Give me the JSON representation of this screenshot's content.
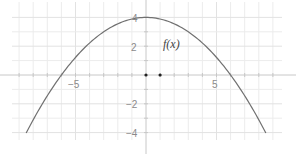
{
  "chart_data": {
    "type": "line",
    "title": "",
    "xlabel": "",
    "ylabel": "",
    "function_label": "f(x)",
    "expression": "f(x) = 4 - x^2/9",
    "xlim": [
      -10.5,
      10.5
    ],
    "ylim": [
      -5.5,
      5.2
    ],
    "grid": true,
    "minor_grid_step": 1,
    "major_grid_step": 2.5,
    "x_tick_labels": [
      {
        "value": -5,
        "label": "−5"
      },
      {
        "value": 5,
        "label": "5"
      }
    ],
    "y_tick_labels": [
      {
        "value": 4,
        "label": "4"
      },
      {
        "value": 2,
        "label": "2"
      },
      {
        "value": -2,
        "label": "−2"
      },
      {
        "value": -4,
        "label": "−4"
      }
    ],
    "series": [
      {
        "name": "f(x)",
        "x": [
          -8.5,
          -8,
          -7,
          -6,
          -5,
          -4,
          -3,
          -2,
          -1,
          0,
          1,
          2,
          3,
          4,
          5,
          6,
          7,
          8,
          8.5
        ],
        "values": [
          -4.03,
          -3.11,
          -1.44,
          0.0,
          1.22,
          2.22,
          3.0,
          3.56,
          3.89,
          4.0,
          3.89,
          3.56,
          3.0,
          2.22,
          1.22,
          0.0,
          -1.44,
          -3.11,
          -4.03
        ]
      }
    ],
    "points": [
      {
        "x": 0,
        "y": 0
      },
      {
        "x": 1,
        "y": 0
      }
    ],
    "colors": {
      "curve": "#707070",
      "axis": "#c8c8c8",
      "grid": "#ececec",
      "points": "#222222"
    }
  },
  "labels": {
    "function": "f(x)",
    "x_neg5": "−5",
    "x_pos5": "5",
    "y_4": "4",
    "y_2": "2",
    "y_neg2": "−2",
    "y_neg4": "−4"
  }
}
